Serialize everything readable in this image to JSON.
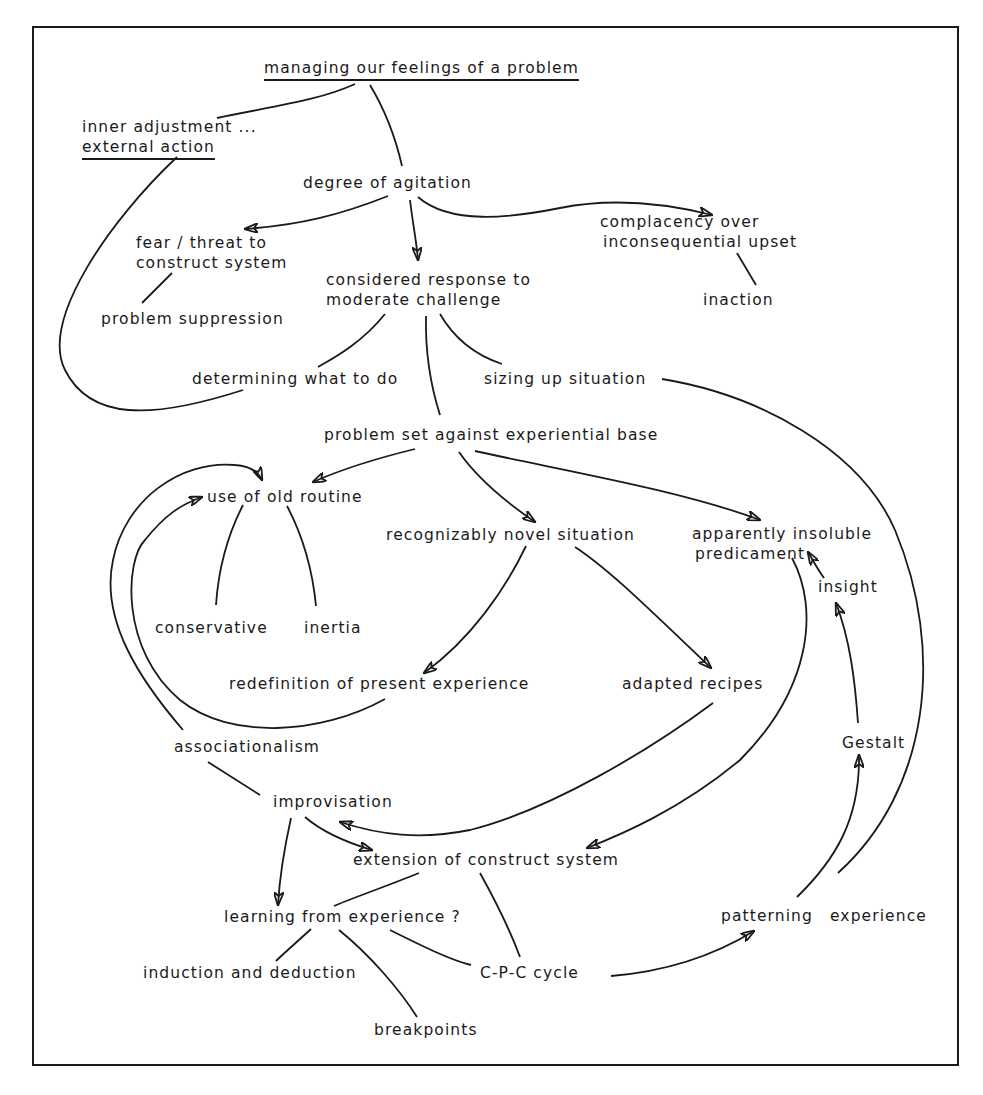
{
  "diagram": {
    "type": "concept-map",
    "nodes": {
      "managing": {
        "label": "managing our feelings of a problem"
      },
      "inner": {
        "line1": "inner adjustment ...",
        "line2": "external action"
      },
      "agitation": {
        "label": "degree of agitation"
      },
      "fear": {
        "line1": "fear / threat to",
        "line2": "construct system"
      },
      "complacency": {
        "line1": "complacency over",
        "line2": "inconsequential upset"
      },
      "considered": {
        "line1": "considered response to",
        "line2": "moderate challenge"
      },
      "suppression": {
        "label": "problem suppression"
      },
      "inaction": {
        "label": "inaction"
      },
      "determining": {
        "label": "determining what to do"
      },
      "sizing": {
        "label": "sizing up situation"
      },
      "problemset": {
        "label": "problem set against experiential base"
      },
      "oldroutine": {
        "label": "use of old routine"
      },
      "novel": {
        "label": "recognizably novel situation"
      },
      "insoluble": {
        "line1": "apparently insoluble",
        "line2": "predicament"
      },
      "conservative": {
        "label": "conservative"
      },
      "inertia": {
        "label": "inertia"
      },
      "insight": {
        "label": "insight"
      },
      "redefinition": {
        "label": "redefinition of present experience"
      },
      "recipes": {
        "label": "adapted recipes"
      },
      "gestalt": {
        "label": "Gestalt"
      },
      "associationalism": {
        "label": "associationalism"
      },
      "improvisation": {
        "label": "improvisation"
      },
      "extension": {
        "label": "extension of construct system"
      },
      "learning": {
        "label": "learning from experience ?"
      },
      "patterning": {
        "label": "patterning"
      },
      "experience": {
        "label": "experience"
      },
      "induction": {
        "label": "induction and deduction"
      },
      "cpc": {
        "label": "C-P-C cycle"
      },
      "breakpoints": {
        "label": "breakpoints"
      }
    },
    "edges": [
      {
        "from": "managing",
        "to": "inner",
        "arrow": false
      },
      {
        "from": "managing",
        "to": "agitation",
        "arrow": false
      },
      {
        "from": "inner",
        "to": "determining",
        "arrow": false
      },
      {
        "from": "agitation",
        "to": "fear",
        "arrow": true
      },
      {
        "from": "agitation",
        "to": "considered",
        "arrow": true
      },
      {
        "from": "agitation",
        "to": "complacency",
        "arrow": true
      },
      {
        "from": "fear",
        "to": "suppression",
        "arrow": false
      },
      {
        "from": "complacency",
        "to": "inaction",
        "arrow": false
      },
      {
        "from": "considered",
        "to": "determining",
        "arrow": false
      },
      {
        "from": "considered",
        "to": "sizing",
        "arrow": false
      },
      {
        "from": "considered",
        "to": "problemset",
        "arrow": false
      },
      {
        "from": "sizing",
        "to": "experience",
        "arrow": false
      },
      {
        "from": "problemset",
        "to": "oldroutine",
        "arrow": true
      },
      {
        "from": "problemset",
        "to": "novel",
        "arrow": true
      },
      {
        "from": "problemset",
        "to": "insoluble",
        "arrow": true
      },
      {
        "from": "oldroutine",
        "to": "conservative",
        "arrow": false
      },
      {
        "from": "oldroutine",
        "to": "inertia",
        "arrow": false
      },
      {
        "from": "novel",
        "to": "redefinition",
        "arrow": true
      },
      {
        "from": "novel",
        "to": "recipes",
        "arrow": true
      },
      {
        "from": "redefinition",
        "to": "oldroutine",
        "arrow": true
      },
      {
        "from": "associationalism",
        "to": "oldroutine",
        "arrow": true
      },
      {
        "from": "associationalism",
        "to": "improvisation",
        "arrow": false
      },
      {
        "from": "recipes",
        "to": "improvisation",
        "arrow": true
      },
      {
        "from": "insoluble",
        "to": "extension",
        "arrow": true
      },
      {
        "from": "improvisation",
        "to": "extension",
        "arrow": true
      },
      {
        "from": "improvisation",
        "to": "learning",
        "arrow": true
      },
      {
        "from": "extension",
        "to": "learning",
        "arrow": false
      },
      {
        "from": "extension",
        "to": "cpc",
        "arrow": false
      },
      {
        "from": "learning",
        "to": "induction",
        "arrow": false
      },
      {
        "from": "learning",
        "to": "breakpoints",
        "arrow": false
      },
      {
        "from": "learning",
        "to": "cpc",
        "arrow": false
      },
      {
        "from": "cpc",
        "to": "patterning",
        "arrow": true
      },
      {
        "from": "patterning",
        "to": "gestalt",
        "arrow": true
      },
      {
        "from": "gestalt",
        "to": "insight",
        "arrow": true
      },
      {
        "from": "insight",
        "to": "insoluble",
        "arrow": true
      }
    ]
  }
}
